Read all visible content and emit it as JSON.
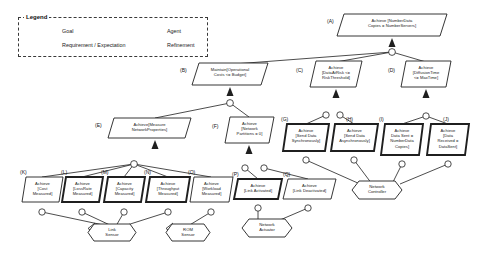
{
  "legend": {
    "title": "Legend",
    "items": [
      {
        "key": "goal",
        "label": "Goal",
        "shape": "parallelogram"
      },
      {
        "key": "agent",
        "label": "Agent",
        "shape": "ellipse"
      },
      {
        "key": "requirement",
        "label": "Requirement / Expectation",
        "shape": "thick-parallelogram"
      },
      {
        "key": "refinement",
        "label": "Refinement",
        "shape": "refinement-arrow"
      }
    ]
  },
  "diagram": {
    "type": "kaos-goal-model",
    "nodes": [
      {
        "tag": "(A)",
        "id": "A",
        "label": "Achieve [NumberData\nCopies = NumberServers]",
        "shape": "goal",
        "x": 337,
        "y": 14,
        "w": 110,
        "h": 22
      },
      {
        "tag": "(B)",
        "id": "B",
        "label": "Maintain[Operational\nCosts <= Budget]",
        "shape": "goal",
        "x": 192,
        "y": 63,
        "w": 76,
        "h": 22
      },
      {
        "tag": "(C)",
        "id": "C",
        "label": "Achieve\n[DataAtRisk <=\nRiskThreshold]",
        "shape": "goal",
        "x": 310,
        "y": 61,
        "w": 52,
        "h": 26
      },
      {
        "tag": "(D)",
        "id": "D",
        "label": "Achieve\n[DiffusionTime\n<= MaxTime]",
        "shape": "goal",
        "x": 401,
        "y": 61,
        "w": 50,
        "h": 26
      },
      {
        "tag": "(E)",
        "id": "E",
        "label": "Achieve[Measure\nNetworkProperties]",
        "shape": "goal",
        "x": 108,
        "y": 118,
        "w": 83,
        "h": 20
      },
      {
        "tag": "(F)",
        "id": "F",
        "label": "Achieve\n[Network\nPartitions = 0]",
        "shape": "goal",
        "x": 225,
        "y": 117,
        "w": 49,
        "h": 26
      },
      {
        "tag": "(G)",
        "id": "G",
        "label": "Achieve\n[Send Data\nSynchronously]",
        "shape": "requirement",
        "x": 283,
        "y": 124,
        "w": 46,
        "h": 27
      },
      {
        "tag": "(H)",
        "id": "H",
        "label": "Achieve\n[Send Data\nAsynchronously]",
        "shape": "requirement",
        "x": 331,
        "y": 124,
        "w": 47,
        "h": 27
      },
      {
        "tag": "(I)",
        "id": "I",
        "label": "Achieve\nData Sent =\nNumberData\nCopies]",
        "shape": "requirement",
        "x": 381,
        "y": 124,
        "w": 42,
        "h": 31
      },
      {
        "tag": "(J)",
        "id": "J",
        "label": "Achieve\n[Data\nReceived =\nDataSent]",
        "shape": "requirement",
        "x": 427,
        "y": 124,
        "w": 42,
        "h": 31
      },
      {
        "tag": "(K)",
        "id": "K",
        "label": "Achieve\n[Cost\nMeasured]",
        "shape": "goal",
        "x": 22,
        "y": 177,
        "w": 41,
        "h": 25
      },
      {
        "tag": "(L)",
        "id": "L",
        "label": "Achieve\n[LossRate\nMeasured]",
        "shape": "requirement",
        "x": 62,
        "y": 177,
        "w": 41,
        "h": 25
      },
      {
        "tag": "(M)",
        "id": "M",
        "label": "Achieve\n[Capacity\nMeasured]",
        "shape": "requirement",
        "x": 104,
        "y": 177,
        "w": 41,
        "h": 25
      },
      {
        "tag": "(N)",
        "id": "N",
        "label": "Achieve\n[Throughput\nMeasured]",
        "shape": "requirement",
        "x": 146,
        "y": 177,
        "w": 44,
        "h": 25
      },
      {
        "tag": "(O)",
        "id": "O",
        "label": "Achieve\n[Workload\nMeasured]",
        "shape": "goal",
        "x": 190,
        "y": 177,
        "w": 43,
        "h": 25
      },
      {
        "tag": "(P)",
        "id": "P",
        "label": "Achieve\n[Link Activated]",
        "shape": "requirement",
        "x": 234,
        "y": 179,
        "w": 48,
        "h": 20
      },
      {
        "tag": "(Q)",
        "id": "Q",
        "label": "Achieve\n[Link Deactivated]",
        "shape": "goal",
        "x": 283,
        "y": 179,
        "w": 53,
        "h": 20
      }
    ],
    "agents": [
      {
        "id": "link-sensor",
        "label": "Link\nSensor",
        "x": 88,
        "y": 224,
        "w": 48,
        "h": 17
      },
      {
        "id": "rom-sensor",
        "label": "ROM\nSensor",
        "x": 166,
        "y": 224,
        "w": 44,
        "h": 17
      },
      {
        "id": "network-actuator",
        "label": "Network\nActuator",
        "x": 242,
        "y": 219,
        "w": 50,
        "h": 18
      },
      {
        "id": "network-controller",
        "label": "Network\nController",
        "x": 352,
        "y": 181,
        "w": 50,
        "h": 18
      }
    ]
  }
}
